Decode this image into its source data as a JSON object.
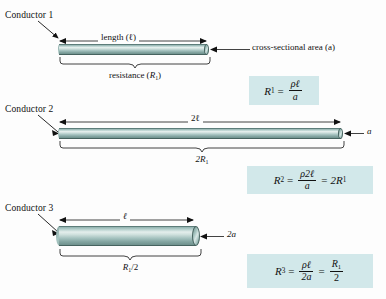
{
  "figure": {
    "background_color": "#fdfdfd",
    "conductor_color": "#a5c2bf",
    "formula_box_color": "#d2e8ea"
  },
  "conductors": [
    {
      "name": "Conductor 1",
      "length_label": "length (ℓ)",
      "brace_label_prefix": "resistance (",
      "brace_label_sym": "R",
      "brace_label_sub": "1",
      "brace_label_suffix": ")",
      "end_label": "cross-sectional area (a)"
    },
    {
      "name": "Conductor 2",
      "length_label": "2ℓ",
      "brace_label_sym": "2R",
      "brace_label_sub": "1",
      "end_label": "a"
    },
    {
      "name": "Conductor 3",
      "length_label": "ℓ",
      "brace_label_sym": "R",
      "brace_label_sub": "1",
      "brace_label_suffix": "/2",
      "end_label": "2a"
    }
  ],
  "formulas": [
    {
      "lhs_sym": "R",
      "lhs_sub": "1",
      "eq": "=",
      "num": "ρℓ",
      "den": "a",
      "tail_eq": "",
      "tail": ""
    },
    {
      "lhs_sym": "R",
      "lhs_sub": "2",
      "eq": "=",
      "num": "ρ2ℓ",
      "den": "a",
      "tail_eq": "=",
      "tail_sym": "2R",
      "tail_sub": "1"
    },
    {
      "lhs_sym": "R",
      "lhs_sub": "3",
      "eq": "=",
      "num": "ρℓ",
      "den": "2a",
      "tail_eq": "=",
      "tail_num_sym": "R",
      "tail_num_sub": "1",
      "tail_den": "2"
    }
  ]
}
